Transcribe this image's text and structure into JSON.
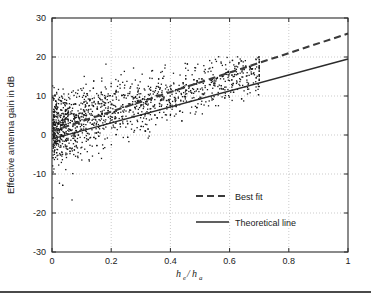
{
  "chart_data": {
    "type": "scatter",
    "title": "",
    "xlabel": "h_e/h_a",
    "xlabel_parts": {
      "num_base": "h",
      "num_sub": "e",
      "slash": "/",
      "den_base": "h",
      "den_sub": "a"
    },
    "ylabel": "Effective antenna gain in dB",
    "xlim": [
      0,
      1
    ],
    "ylim": [
      -30,
      30
    ],
    "xticks": [
      0,
      0.2,
      0.4,
      0.6,
      0.8,
      1
    ],
    "xtick_labels": [
      "0",
      "0.2",
      "0.4",
      "0.6",
      "0.8",
      "1"
    ],
    "yticks": [
      -30,
      -20,
      -10,
      0,
      10,
      20,
      30
    ],
    "ytick_labels": [
      "-30",
      "-20",
      "-10",
      "0",
      "10",
      "20",
      "30"
    ],
    "grid": true,
    "grid_style": "dotted",
    "legend_position": "center-right-inside",
    "series": [
      {
        "name": "Best fit",
        "type": "line",
        "style": "dashed",
        "color": "#3a3a3a",
        "x": [
          0,
          1
        ],
        "y": [
          1.0,
          26.0
        ],
        "slope": 25.0,
        "intercept": 1.0
      },
      {
        "name": "Theoretical line",
        "type": "line",
        "style": "solid",
        "color": "#2b2b2b",
        "x": [
          0,
          1
        ],
        "y": [
          -1.0,
          19.5
        ],
        "slope": 20.5,
        "intercept": -1.0
      },
      {
        "name": "Measurements",
        "type": "scatter",
        "color": "#171717",
        "marker": "dot",
        "point_count": 1600,
        "x_range": [
          0.0,
          0.7
        ],
        "y_range": [
          -28,
          20
        ],
        "description": "Dense cloud of measured effective antenna gain samples concentrated between he/ha = 0 and 0.6, spreading from about -28 dB to +20 dB, with density highest near he/ha < 0.25 and gain between -5 and +12 dB."
      }
    ],
    "legend": [
      {
        "label": "Best fit",
        "style": "dashed"
      },
      {
        "label": "Theoretical line",
        "style": "solid"
      }
    ]
  },
  "figure": {
    "background": "#ffffff",
    "axis_color": "#2b2b2b",
    "grid_color": "#a8a8a8",
    "point_color": "#171717"
  }
}
